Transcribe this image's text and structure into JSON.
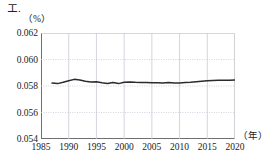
{
  "figure": {
    "label": "エ."
  },
  "axes": {
    "y_unit": "（%）",
    "x_unit": "（年）",
    "y_ticks": [
      "0.062",
      "0.060",
      "0.058",
      "0.056",
      "0.054"
    ],
    "x_ticks": [
      "1985",
      "1990",
      "1995",
      "2000",
      "2005",
      "2010",
      "2015",
      "2020"
    ]
  },
  "style": {
    "line_color": "#2b2b2b",
    "grid_color": "#c9c9d6",
    "axis_color": "#6f6f6f",
    "background": "#ffffff"
  },
  "chart_data": {
    "type": "line",
    "title": "エ.",
    "xlabel": "（年）",
    "ylabel": "（%）",
    "xlim": [
      1985,
      2020
    ],
    "ylim": [
      0.054,
      0.062
    ],
    "grid": true,
    "legend": "none",
    "x": [
      1987,
      1988,
      1989,
      1990,
      1991,
      1992,
      1993,
      1994,
      1995,
      1996,
      1997,
      1998,
      1999,
      2000,
      2001,
      2002,
      2003,
      2004,
      2005,
      2006,
      2007,
      2008,
      2009,
      2010,
      2011,
      2012,
      2013,
      2014,
      2015,
      2016,
      2017,
      2018,
      2019,
      2020
    ],
    "series": [
      {
        "name": "割合",
        "values": [
          0.05822,
          0.05818,
          0.05828,
          0.0584,
          0.0585,
          0.05846,
          0.05836,
          0.0583,
          0.05832,
          0.05824,
          0.05818,
          0.05826,
          0.05818,
          0.05828,
          0.0583,
          0.05828,
          0.05827,
          0.05826,
          0.05825,
          0.05824,
          0.05823,
          0.05826,
          0.05822,
          0.05823,
          0.05826,
          0.05828,
          0.05832,
          0.05836,
          0.0584,
          0.05842,
          0.05843,
          0.05844,
          0.05844,
          0.05845
        ]
      }
    ]
  }
}
